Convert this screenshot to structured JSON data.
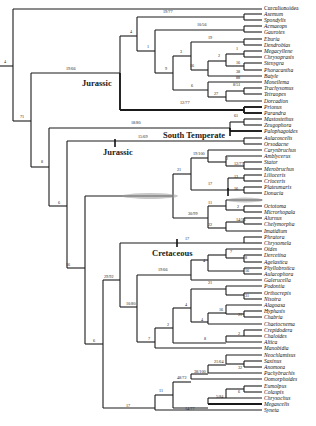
{
  "figure": {
    "type": "phylogenetic-tree",
    "leaves": [
      {
        "name": "Curculionoidea",
        "y": 8,
        "roman": true
      },
      {
        "name": "Asemum",
        "y": 14
      },
      {
        "name": "Spondylis",
        "y": 20
      },
      {
        "name": "Acmaeops",
        "y": 26
      },
      {
        "name": "Gaurotes",
        "y": 32
      },
      {
        "name": "Eburia",
        "y": 39
      },
      {
        "name": "Dendrobias",
        "y": 45
      },
      {
        "name": "Megacyllene",
        "y": 51
      },
      {
        "name": "Chrysoprasis",
        "y": 57
      },
      {
        "name": "Stenygra",
        "y": 63
      },
      {
        "name": "Phoracantha",
        "y": 70
      },
      {
        "name": "Batyle",
        "y": 76
      },
      {
        "name": "Moneilema",
        "y": 82
      },
      {
        "name": "Trachysomus",
        "y": 88
      },
      {
        "name": "Tetraopes",
        "y": 94
      },
      {
        "name": "Dorcadion",
        "y": 101
      },
      {
        "name": "Prionus",
        "y": 107
      },
      {
        "name": "Parandra",
        "y": 113
      },
      {
        "name": "Mastostethus",
        "y": 119
      },
      {
        "name": "Zeugophora",
        "y": 125
      },
      {
        "name": "Palophagoides",
        "y": 131
      },
      {
        "name": "Aulacoscelis",
        "y": 138
      },
      {
        "name": "Orsodacne",
        "y": 144
      },
      {
        "name": "Carynbruchus",
        "y": 150
      },
      {
        "name": "Amblycerus",
        "y": 156
      },
      {
        "name": "Stator",
        "y": 162
      },
      {
        "name": "Merobruchus",
        "y": 169
      },
      {
        "name": "Lilioceris",
        "y": 175
      },
      {
        "name": "Crioceris",
        "y": 181
      },
      {
        "name": "Plateumaris",
        "y": 187
      },
      {
        "name": "Donacia",
        "y": 193
      },
      {
        "name": "",
        "y": 200
      },
      {
        "name": "Octotoma",
        "y": 206
      },
      {
        "name": "Microrhopala",
        "y": 212
      },
      {
        "name": "Alurnus",
        "y": 218
      },
      {
        "name": "Chelymorpha",
        "y": 224
      },
      {
        "name": "Imatidium",
        "y": 231
      },
      {
        "name": "Phratora",
        "y": 237
      },
      {
        "name": "Chrysomela",
        "y": 243
      },
      {
        "name": "Oides",
        "y": 249
      },
      {
        "name": "Dercetina",
        "y": 255
      },
      {
        "name": "Agelastica",
        "y": 262
      },
      {
        "name": "Phyllobrotica",
        "y": 268
      },
      {
        "name": "Aulacophora",
        "y": 274
      },
      {
        "name": "Galerucella",
        "y": 280
      },
      {
        "name": "Podontia",
        "y": 286
      },
      {
        "name": "Orthocrepis",
        "y": 293
      },
      {
        "name": "Nisotra",
        "y": 299
      },
      {
        "name": "Alagoasa",
        "y": 305
      },
      {
        "name": "Hyphasis",
        "y": 311
      },
      {
        "name": "Chabria",
        "y": 317
      },
      {
        "name": "Chaetocnema",
        "y": 324
      },
      {
        "name": "Crepidodera",
        "y": 330
      },
      {
        "name": "Chaloides",
        "y": 336
      },
      {
        "name": "Altica",
        "y": 342
      },
      {
        "name": "Manobidia",
        "y": 348
      },
      {
        "name": "Neochlamisus",
        "y": 355
      },
      {
        "name": "Saxinus",
        "y": 361
      },
      {
        "name": "Anomoea",
        "y": 367
      },
      {
        "name": "Pachybrachis",
        "y": 373
      },
      {
        "name": "Oomorphoides",
        "y": 379
      },
      {
        "name": "Eumolpus",
        "y": 386
      },
      {
        "name": "Colaspis",
        "y": 392
      },
      {
        "name": "Chrysochus",
        "y": 398
      },
      {
        "name": "Megascelis",
        "y": 404
      },
      {
        "name": "Syneta",
        "y": 410
      }
    ],
    "era_labels": [
      {
        "text": "Jurassic",
        "x": 82,
        "y": 86
      },
      {
        "text": "South Temperate",
        "x": 163,
        "y": 138
      },
      {
        "text": "Jurassic",
        "x": 103,
        "y": 155
      },
      {
        "text": "Cretaceous",
        "x": 152,
        "y": 256
      }
    ],
    "support_values": [
      {
        "text": "4",
        "x": 4,
        "y": 63
      },
      {
        "text": "71",
        "x": 20,
        "y": 118
      },
      {
        "text": "19/66",
        "x": 66,
        "y": 70
      },
      {
        "text": "4",
        "x": 130,
        "y": 33
      },
      {
        "text": "19/77",
        "x": 163,
        "y": 13
      },
      {
        "text": "10/56",
        "x": 197,
        "y": 26
      },
      {
        "text": "1",
        "x": 147,
        "y": 48
      },
      {
        "text": "19",
        "x": 208,
        "y": 39
      },
      {
        "text": "3",
        "x": 180,
        "y": 53
      },
      {
        "text": "9",
        "x": 165,
        "y": 70
      },
      {
        "text": "1",
        "x": 236,
        "y": 50
      },
      {
        "text": "2",
        "x": 218,
        "y": 57
      },
      {
        "text": "16",
        "x": 190,
        "y": 67
      },
      {
        "text": "16",
        "x": 236,
        "y": 64
      },
      {
        "text": "38",
        "x": 236,
        "y": 73
      },
      {
        "text": "88",
        "x": 236,
        "y": 79
      },
      {
        "text": "6",
        "x": 191,
        "y": 87
      },
      {
        "text": "8/51",
        "x": 233,
        "y": 86
      },
      {
        "text": "27",
        "x": 214,
        "y": 95
      },
      {
        "text": "12/77",
        "x": 180,
        "y": 104
      },
      {
        "text": "61",
        "x": 234,
        "y": 117
      },
      {
        "text": "18/80",
        "x": 131,
        "y": 124
      },
      {
        "text": "15/69",
        "x": 138,
        "y": 138
      },
      {
        "text": "8",
        "x": 41,
        "y": 163
      },
      {
        "text": "19/100",
        "x": 193,
        "y": 155
      },
      {
        "text": "2",
        "x": 226,
        "y": 160
      },
      {
        "text": "12/77",
        "x": 234,
        "y": 165
      },
      {
        "text": "21",
        "x": 177,
        "y": 171
      },
      {
        "text": "13",
        "x": 234,
        "y": 178
      },
      {
        "text": "17",
        "x": 208,
        "y": 185
      },
      {
        "text": "16",
        "x": 234,
        "y": 190
      },
      {
        "text": "6",
        "x": 58,
        "y": 204
      },
      {
        "text": "11",
        "x": 208,
        "y": 204
      },
      {
        "text": "2",
        "x": 237,
        "y": 208
      },
      {
        "text": "30/99",
        "x": 188,
        "y": 215
      },
      {
        "text": "14/56",
        "x": 236,
        "y": 221
      },
      {
        "text": "22",
        "x": 208,
        "y": 226
      },
      {
        "text": "17",
        "x": 185,
        "y": 240
      },
      {
        "text": "7",
        "x": 230,
        "y": 253
      },
      {
        "text": "8",
        "x": 245,
        "y": 259
      },
      {
        "text": "4",
        "x": 203,
        "y": 262
      },
      {
        "text": "16",
        "x": 66,
        "y": 266
      },
      {
        "text": "16",
        "x": 245,
        "y": 272
      },
      {
        "text": "19/66",
        "x": 158,
        "y": 271
      },
      {
        "text": "29/92",
        "x": 104,
        "y": 278
      },
      {
        "text": "21",
        "x": 208,
        "y": 284
      },
      {
        "text": "31",
        "x": 245,
        "y": 297
      },
      {
        "text": "10/80",
        "x": 126,
        "y": 305
      },
      {
        "text": "4",
        "x": 185,
        "y": 306
      },
      {
        "text": "16",
        "x": 219,
        "y": 311
      },
      {
        "text": "21",
        "x": 238,
        "y": 316
      },
      {
        "text": "4",
        "x": 201,
        "y": 321
      },
      {
        "text": "2",
        "x": 167,
        "y": 326
      },
      {
        "text": "7",
        "x": 148,
        "y": 340
      },
      {
        "text": "8",
        "x": 204,
        "y": 340
      },
      {
        "text": "2",
        "x": 238,
        "y": 335
      },
      {
        "text": "6",
        "x": 93,
        "y": 342
      },
      {
        "text": "21/64",
        "x": 214,
        "y": 363
      },
      {
        "text": "32",
        "x": 238,
        "y": 369
      },
      {
        "text": "38/100",
        "x": 194,
        "y": 373
      },
      {
        "text": "48/72",
        "x": 177,
        "y": 379
      },
      {
        "text": "11",
        "x": 159,
        "y": 392
      },
      {
        "text": "6",
        "x": 238,
        "y": 393
      },
      {
        "text": "5/84",
        "x": 216,
        "y": 398
      },
      {
        "text": "14/77",
        "x": 185,
        "y": 410
      },
      {
        "text": "17",
        "x": 126,
        "y": 407
      }
    ],
    "divergence_ticks": [
      {
        "x": 230,
        "y": 132
      },
      {
        "x": 115,
        "y": 143
      },
      {
        "x": 228,
        "y": 192
      },
      {
        "x": 177,
        "y": 243
      }
    ]
  }
}
